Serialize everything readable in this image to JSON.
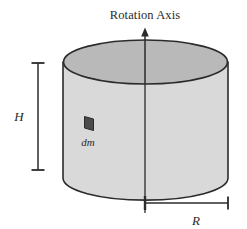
{
  "diagram": {
    "title": "Rotation Axis",
    "labels": {
      "height": "H",
      "radius": "R",
      "mass_element": "dm"
    },
    "icons": {
      "axis_arrow": "arrow-up-icon",
      "mass_element_patch": "parallelogram-patch-icon"
    },
    "colors": {
      "outline": "#2b2b2b",
      "top_face_fill": "#b9b9b9",
      "body_fill": "#d9d9d9",
      "mass_element_fill": "#4a4a4a",
      "background": "#ffffff",
      "text": "#2b2b2b"
    },
    "geometry": {
      "cylinder_left_x": 63,
      "cylinder_right_x": 228,
      "top_ellipse_center_y": 62,
      "bottom_ellipse_center_y": 178,
      "ellipse_radius_x": 82,
      "ellipse_radius_y": 22,
      "axis_x": 145,
      "axis_top_y": 28,
      "height_dim_x": 38,
      "height_dim_top_y": 63,
      "height_dim_bottom_y": 170,
      "radius_dim_y": 203,
      "radius_dim_left_x": 145,
      "radius_dim_right_x": 228
    }
  }
}
